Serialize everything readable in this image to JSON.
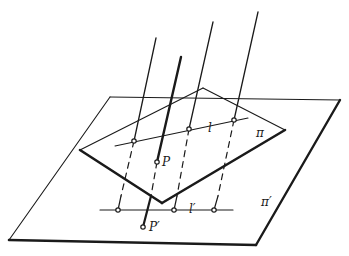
{
  "figure": {
    "type": "projection-diagram",
    "colors": {
      "ink": "#1a1a1a",
      "background": "#ffffff"
    }
  },
  "labels": {
    "line_l": "l",
    "plane_pi": "π",
    "point_P": "P",
    "line_l_prime": "l′",
    "plane_pi_prime": "π′",
    "point_P_prime": "P′"
  }
}
